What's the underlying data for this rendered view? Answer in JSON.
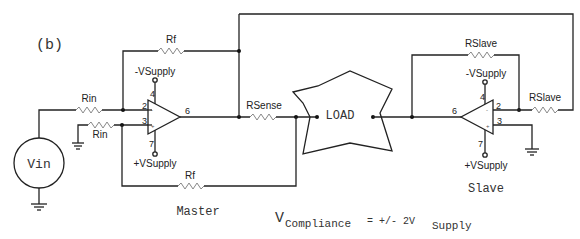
{
  "figure_label": "(b)",
  "master": {
    "title": "Master",
    "rf_top_label": "Rf",
    "rf_bottom_label": "Rf",
    "rin_top_label": "Rin",
    "rin_bottom_label": "Rin",
    "neg_supply": "-VSupply",
    "pos_supply": "+VSupply",
    "pins": {
      "inv": "2",
      "noninv": "3",
      "out": "6",
      "vneg": "4",
      "vpos": "7"
    }
  },
  "source": {
    "label": "Vin"
  },
  "rsense_label": "RSense",
  "load_label": "LOAD",
  "slave": {
    "title": "Slave",
    "rslave_fb_label": "RSlave",
    "rslave_in_label": "RSlave",
    "neg_supply": "-VSupply",
    "pos_supply": "+VSupply",
    "pins": {
      "inv": "2",
      "noninv": "3",
      "out": "6",
      "vneg": "4",
      "vpos": "7"
    }
  },
  "formula": {
    "v": "V",
    "sub1": "Compliance",
    "middle": "= +/- 2V",
    "sub2": "Supply"
  }
}
